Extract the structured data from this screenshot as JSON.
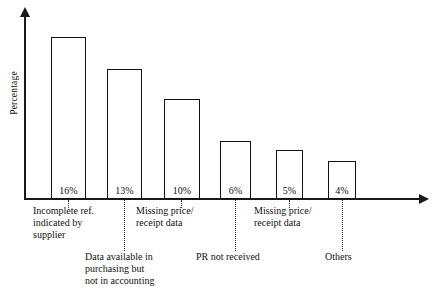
{
  "chart_data": {
    "type": "bar",
    "title": "",
    "subtitle": "",
    "xlabel": "",
    "ylabel": "Percentage",
    "grid": false,
    "legend": "none",
    "ylim": [
      0,
      18
    ],
    "value_suffix": "%",
    "categories": [
      "Incomplete ref.\nindicated by\nsupplier",
      "Data available in\npurchasing but\nnot in accounting",
      "Missing price/\nreceipt data",
      "PR not received",
      "Missing price/\nreceipt data",
      "Others"
    ],
    "values": [
      16,
      13,
      10,
      6,
      5,
      4
    ],
    "value_labels": [
      "16%",
      "13%",
      "10%",
      "6%",
      "5%",
      "4%"
    ],
    "label_rows": [
      "upper",
      "lower",
      "upper",
      "lower",
      "upper",
      "lower"
    ],
    "axis_style": {
      "y_arrow": true,
      "x_arrow": true,
      "bar_fill": "#ffffff",
      "bar_stroke": "#111111",
      "axis_color": "#1a1a1a",
      "text_color": "#111111",
      "background": "#ffffff"
    }
  },
  "bars": [
    {
      "value_label": "16%",
      "left": 51,
      "width": 35,
      "top": 37,
      "height": 162
    },
    {
      "value_label": "13%",
      "left": 107,
      "width": 35,
      "top": 69,
      "height": 130
    },
    {
      "value_label": "10%",
      "left": 164,
      "width": 36,
      "top": 99,
      "height": 100
    },
    {
      "value_label": "6%",
      "left": 220,
      "width": 31,
      "top": 141,
      "height": 58
    },
    {
      "value_label": "5%",
      "left": 276,
      "width": 27,
      "top": 150,
      "height": 49
    },
    {
      "value_label": "4%",
      "left": 328,
      "width": 28,
      "top": 161,
      "height": 38
    }
  ],
  "category_labels": [
    {
      "text": "Incomplete ref.\nindicated by\nsupplier",
      "left": 33,
      "top": 205
    },
    {
      "text": "Data available in\npurchasing but\nnot in accounting",
      "left": 85,
      "top": 251
    },
    {
      "text": "Missing price/\nreceipt data",
      "left": 136,
      "top": 205
    },
    {
      "text": "PR not received",
      "left": 196,
      "top": 251
    },
    {
      "text": "Missing price/\nreceipt data",
      "left": 254,
      "top": 205
    },
    {
      "text": "Others",
      "left": 325,
      "top": 251
    }
  ],
  "leaders": [
    {
      "left": 68,
      "top": 200,
      "height": 8
    },
    {
      "left": 124,
      "top": 200,
      "height": 51
    },
    {
      "left": 181,
      "top": 200,
      "height": 8
    },
    {
      "left": 235,
      "top": 200,
      "height": 51
    },
    {
      "left": 289,
      "top": 200,
      "height": 8
    },
    {
      "left": 342,
      "top": 200,
      "height": 51
    }
  ]
}
